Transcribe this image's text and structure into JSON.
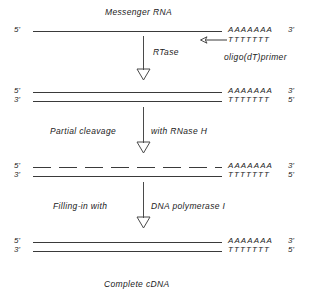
{
  "diagram": {
    "title": "Messenger RNA",
    "footer": "Complete cDNA",
    "steps": [
      {
        "id": "rtase",
        "label": "RTase",
        "label_left": "",
        "label_right": ""
      },
      {
        "id": "rnaseh",
        "label_left": "Partial cleavage",
        "label_right": "with RNase H"
      },
      {
        "id": "polymerase",
        "label_left": "Filling-in with",
        "label_right": "DNA polymerase I"
      }
    ],
    "primer": {
      "sequence": "TTTTTTT",
      "caption": "oligo(dT)primer",
      "arrow_direction": "left"
    },
    "panels": [
      {
        "id": "panel-mrna",
        "top": {
          "left_end": "5'",
          "right_end": "3'",
          "sequence": "AAAAAAA",
          "style": "solid"
        },
        "bottom": null
      },
      {
        "id": "panel-rna-dna-hybrid",
        "top": {
          "left_end": "5'",
          "right_end": "3'",
          "sequence": "AAAAAAA",
          "style": "solid"
        },
        "bottom": {
          "left_end": "3'",
          "right_end": "5'",
          "sequence": "TTTTTTT",
          "style": "solid"
        }
      },
      {
        "id": "panel-cleaved",
        "top": {
          "left_end": "5'",
          "right_end": "3'",
          "sequence": "AAAAAAA",
          "style": "dashed"
        },
        "bottom": {
          "left_end": "3'",
          "right_end": "5'",
          "sequence": "TTTTTTT",
          "style": "solid"
        }
      },
      {
        "id": "panel-complete-cdna",
        "top": {
          "left_end": "5'",
          "right_end": "3'",
          "sequence": "AAAAAAA",
          "style": "solid"
        },
        "bottom": {
          "left_end": "3'",
          "right_end": "5'",
          "sequence": "TTTTTTT",
          "style": "solid"
        }
      }
    ],
    "colors": {
      "line": "#3a3a3a",
      "text": "#222222",
      "background": "#ffffff"
    }
  }
}
